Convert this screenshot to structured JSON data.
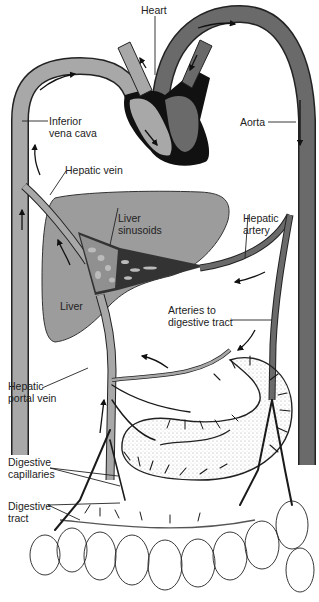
{
  "diagram": {
    "type": "anatomical-circulation",
    "colors": {
      "venous": "#a8a8a8",
      "arterial": "#6a6a6a",
      "heart_outline": "#111111",
      "liver": "#9c9c9c",
      "outline": "#222222",
      "background": "#ffffff"
    },
    "labels": {
      "heart": "Heart",
      "inferior_vena_cava": "Inferior\nvena cava",
      "aorta": "Aorta",
      "hepatic_vein": "Hepatic vein",
      "liver_sinusoids": "Liver\nsinusoids",
      "hepatic_artery": "Hepatic\nartery",
      "liver": "Liver",
      "arteries_to_digestive_tract": "Arteries to\ndigestive tract",
      "hepatic_portal_vein": "Hepatic\nportal vein",
      "digestive_capillaries": "Digestive\ncapillaries",
      "digestive_tract": "Digestive\ntract"
    }
  }
}
